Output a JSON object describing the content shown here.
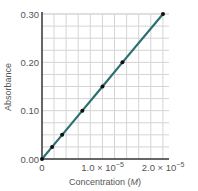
{
  "chart_data": {
    "type": "line",
    "title": "",
    "xlabel": "Concentration (M)",
    "xlabel_main": "Concentration (",
    "xlabel_unit": "M",
    "xlabel_end": ")",
    "ylabel": "Absorbance",
    "xlim": [
      0,
      2.1e-05
    ],
    "ylim": [
      0,
      0.3
    ],
    "grid": true,
    "legend": null,
    "x_ticks": [
      {
        "value": 0,
        "label": "0"
      },
      {
        "value": 1e-05,
        "label": "1.0 × 10",
        "exp": "−5"
      },
      {
        "value": 2e-05,
        "label": "2.0 × 10",
        "exp": "−5"
      }
    ],
    "y_ticks": [
      {
        "value": 0.0,
        "label": "0.00"
      },
      {
        "value": 0.1,
        "label": "0.10"
      },
      {
        "value": 0.2,
        "label": "0.20"
      },
      {
        "value": 0.3,
        "label": "0.30"
      }
    ],
    "series": [
      {
        "name": "Absorbance vs Concentration",
        "color": "#2a6f73",
        "x": [
          0,
          1.67e-06,
          3.33e-06,
          6.67e-06,
          1e-05,
          1.33e-05,
          2e-05
        ],
        "y": [
          0.0,
          0.025,
          0.05,
          0.1,
          0.15,
          0.2,
          0.3
        ]
      }
    ]
  },
  "colors": {
    "line": "#2a6f73",
    "point": "#111111",
    "grid": "#d4d4d4",
    "axis": "#333333"
  }
}
